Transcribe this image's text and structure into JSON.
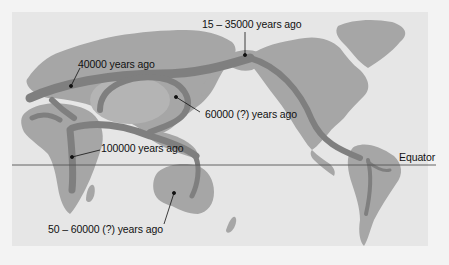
{
  "map": {
    "title": "Human migration routes",
    "colors": {
      "background": "#e6e6e6",
      "land": "#a6a6a6",
      "route": "#7f7f7f",
      "equator_line": "#555555",
      "text": "#111111"
    },
    "equator": {
      "label": "Equator"
    },
    "annotations": [
      {
        "id": "europe",
        "label": "40000 years ago",
        "region": "Europe"
      },
      {
        "id": "bering",
        "label": "15 – 35000 years ago",
        "region": "Bering Strait"
      },
      {
        "id": "east-asia",
        "label": "60000 (?) years ago",
        "region": "East Asia"
      },
      {
        "id": "africa",
        "label": "100000 years ago",
        "region": "East Africa"
      },
      {
        "id": "australia",
        "label": "50 – 60000 (?) years ago",
        "region": "Australia"
      }
    ]
  }
}
